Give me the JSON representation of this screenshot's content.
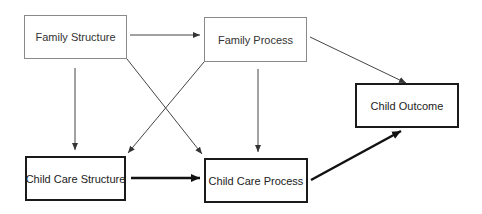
{
  "diagram": {
    "nodes": {
      "family_structure": {
        "label": "Family Structure"
      },
      "family_process": {
        "label": "Family Process"
      },
      "child_outcome": {
        "label": "Child Outcome"
      },
      "child_care_structure": {
        "label": "Child Care Structure"
      },
      "child_care_process": {
        "label": "Child Care Process"
      }
    },
    "edges": [
      {
        "from": "Family Structure",
        "to": "Family Process",
        "weight": "thin"
      },
      {
        "from": "Family Structure",
        "to": "Child Care Structure",
        "weight": "thin"
      },
      {
        "from": "Family Structure",
        "to": "Child Care Process",
        "weight": "thin"
      },
      {
        "from": "Family Process",
        "to": "Child Care Structure",
        "weight": "thin"
      },
      {
        "from": "Family Process",
        "to": "Child Care Process",
        "weight": "thin"
      },
      {
        "from": "Family Process",
        "to": "Child Outcome",
        "weight": "thin"
      },
      {
        "from": "Child Care Structure",
        "to": "Child Care Process",
        "weight": "thick"
      },
      {
        "from": "Child Care Process",
        "to": "Child Outcome",
        "weight": "thick"
      }
    ],
    "colors": {
      "thin_border": "#8a8a8a",
      "thick_border": "#1a1a1a",
      "thin_edge": "#444444",
      "thick_edge": "#111111",
      "text": "#333333"
    }
  }
}
